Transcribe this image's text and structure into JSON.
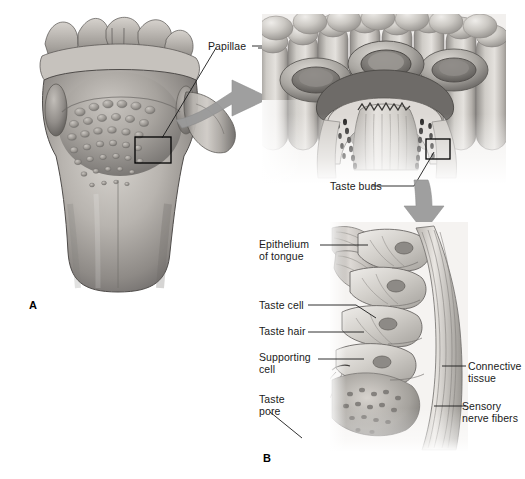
{
  "figure": {
    "background_color": "#ffffff",
    "ink_color": "#1a1a1a",
    "artwork_style": "grayscale-anatomical-illustration"
  },
  "panels": [
    {
      "id": "panel-a",
      "letter": "A",
      "subject": "dorsal-surface-of-tongue",
      "detail_box": "papillae-region"
    },
    {
      "id": "panel-middle",
      "letter": "",
      "subject": "circumvallate-papilla-cross-section",
      "detail_box": "taste-bud-region"
    },
    {
      "id": "panel-b",
      "letter": "B",
      "subject": "taste-bud-microanatomy"
    }
  ],
  "labels": {
    "papillae": "Papillae",
    "taste_buds": "Taste buds",
    "epithelium_of_tongue": "Epithelium\nof tongue",
    "taste_cell": "Taste cell",
    "taste_hair": "Taste hair",
    "supporting_cell": "Supporting\ncell",
    "taste_pore": "Taste\npore",
    "connective_tissue": "Connective\ntissue",
    "sensory_nerve_fibers": "Sensory\nnerve fibers"
  },
  "arrows": [
    {
      "name": "arrow-tongue-to-papilla",
      "direction": "right",
      "color": "#9a9a9a"
    },
    {
      "name": "arrow-papilla-to-tastebud",
      "direction": "down",
      "color": "#9a9a9a"
    }
  ],
  "colors": {
    "tissue_light": "#e8e6e2",
    "tissue_mid": "#b4b0ab",
    "tissue_dark": "#7d7a76",
    "tissue_deep": "#53504d",
    "arrow_gray": "#9a9a9a",
    "leader_line": "#1a1a1a"
  }
}
